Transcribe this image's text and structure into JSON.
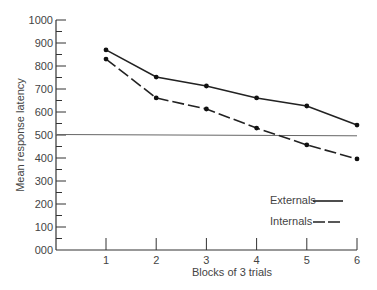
{
  "chart_data": {
    "type": "line",
    "title": "",
    "xlabel": "Blocks of 3 trials",
    "ylabel": "Mean response latency",
    "x": [
      1,
      2,
      3,
      4,
      5,
      6
    ],
    "categories": [
      "1",
      "2",
      "3",
      "4",
      "5",
      "6"
    ],
    "ylim": [
      0,
      1000
    ],
    "y_ticks": [
      "000",
      "100",
      "200",
      "300",
      "400",
      "500",
      "600",
      "700",
      "800",
      "900",
      "1000"
    ],
    "y_minor_ticks_step": 50,
    "grid": false,
    "legend_position": "lower right",
    "series": [
      {
        "name": "Externals",
        "style": "solid",
        "values": [
          870,
          752,
          713,
          661,
          626,
          543
        ]
      },
      {
        "name": "Internals",
        "style": "dashed",
        "values": [
          830,
          661,
          613,
          530,
          457,
          396
        ]
      }
    ],
    "annotations": [
      {
        "type": "reference-line",
        "y_start": 500,
        "y_end": 490,
        "description": "horizontal reference line near 500"
      }
    ]
  },
  "legend": {
    "externals_label": "Externals",
    "internals_label": "Internals"
  },
  "axes": {
    "xlabel": "Blocks of 3 trials",
    "ylabel": "Mean response latency"
  }
}
